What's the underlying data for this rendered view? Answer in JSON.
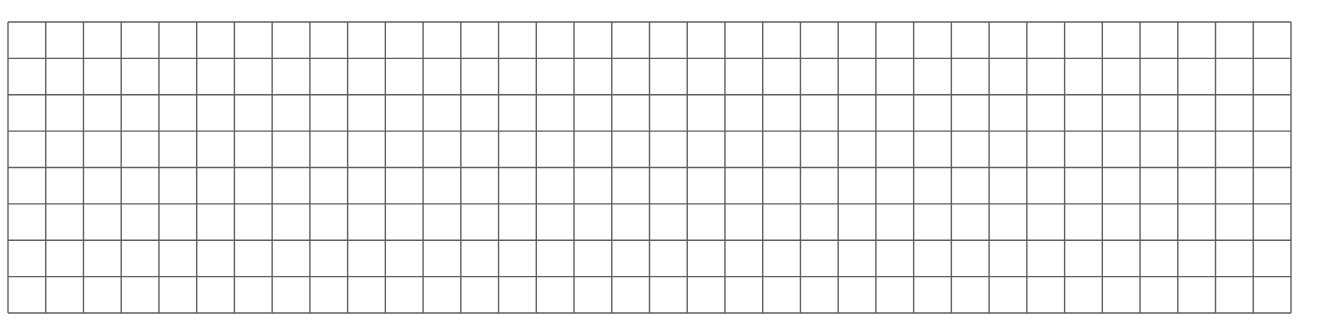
{
  "grid": {
    "columns": 34,
    "rows": 8,
    "line_color": "#5f5f5f",
    "background_color": "#ffffff",
    "cells_filled": false
  }
}
